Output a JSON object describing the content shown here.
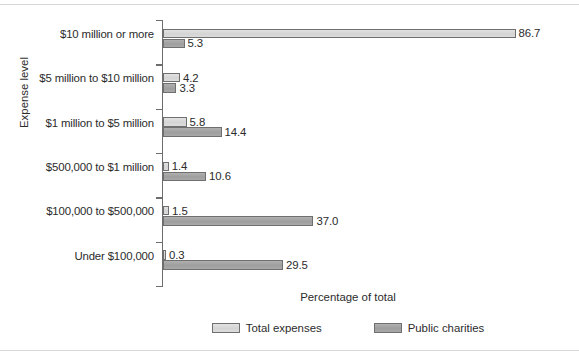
{
  "chart_data": {
    "type": "bar",
    "orientation": "horizontal",
    "title": "",
    "xlabel": "Percentage of total",
    "ylabel": "Expense level",
    "xlim": [
      0,
      91
    ],
    "grid": false,
    "legend_position": "bottom-center",
    "categories": [
      "$10 million or more",
      "$5 million to $10 million",
      "$1 million to $5 million",
      "$500,000 to $1 million",
      "$100,000 to $500,000",
      "Under $100,000"
    ],
    "series": [
      {
        "name": "Total expenses",
        "color": "#dcdcdc",
        "values": [
          86.7,
          4.2,
          5.8,
          1.4,
          1.5,
          0.3
        ],
        "labels": [
          "86.7",
          "4.2",
          "5.8",
          "1.4",
          "1.5",
          "0.3"
        ]
      },
      {
        "name": "Public charities",
        "color": "#a8a8a8",
        "values": [
          5.3,
          3.3,
          14.4,
          10.6,
          37.0,
          29.5
        ],
        "labels": [
          "5.3",
          "3.3",
          "14.4",
          "10.6",
          "37.0",
          "29.5"
        ]
      }
    ]
  },
  "legend": {
    "items": [
      {
        "label": "Total expenses"
      },
      {
        "label": "Public charities"
      }
    ]
  }
}
